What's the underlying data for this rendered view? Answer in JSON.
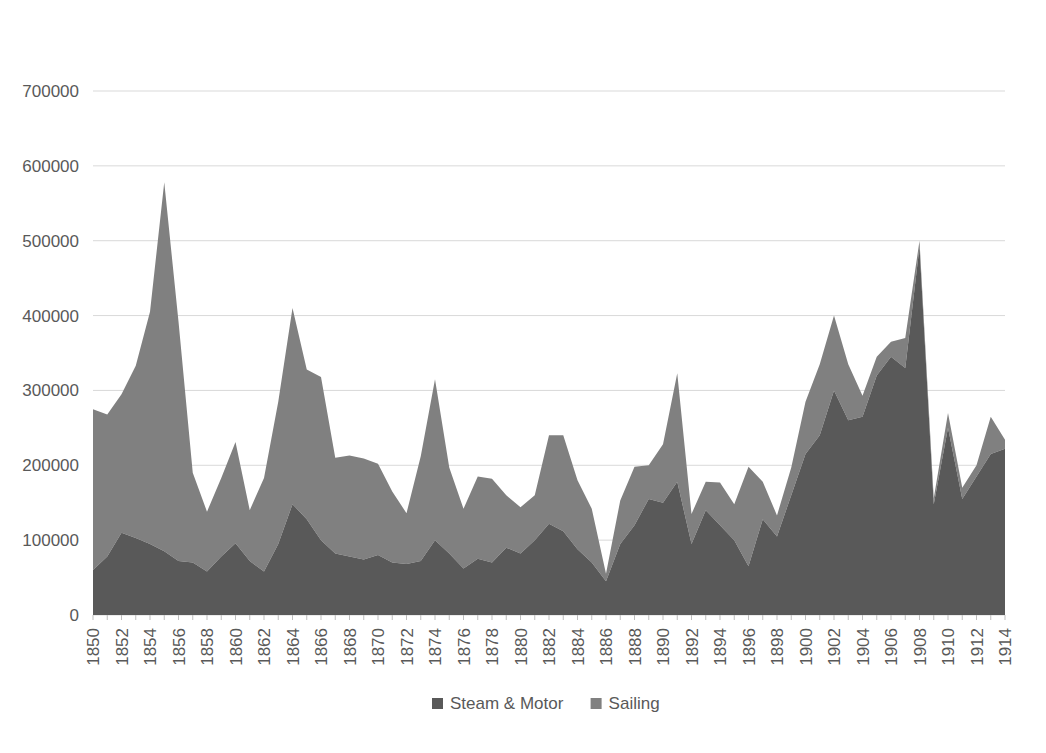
{
  "chart_data": {
    "type": "area",
    "stacked": true,
    "title": "",
    "subtitle": "",
    "xlabel": "",
    "ylabel": "",
    "ylim": [
      0,
      700000
    ],
    "ytick_labels": [
      "0",
      "100000",
      "200000",
      "300000",
      "400000",
      "500000",
      "600000",
      "700000"
    ],
    "ytick_values": [
      0,
      100000,
      200000,
      300000,
      400000,
      500000,
      600000,
      700000
    ],
    "grid": true,
    "grid_axis": "y",
    "legend_position": "bottom",
    "xtick_labels": [
      "1850",
      "1852",
      "1854",
      "1856",
      "1858",
      "1860",
      "1862",
      "1864",
      "1866",
      "1868",
      "1870",
      "1872",
      "1874",
      "1876",
      "1878",
      "1880",
      "1882",
      "1884",
      "1886",
      "1888",
      "1890",
      "1892",
      "1894",
      "1896",
      "1898",
      "1900",
      "1902",
      "1904",
      "1906",
      "1908",
      "1910",
      "1912",
      "1914"
    ],
    "xtick_rotation": 90,
    "x": [
      1850,
      1851,
      1852,
      1853,
      1854,
      1855,
      1856,
      1857,
      1858,
      1859,
      1860,
      1861,
      1862,
      1863,
      1864,
      1865,
      1866,
      1867,
      1868,
      1869,
      1870,
      1871,
      1872,
      1873,
      1874,
      1875,
      1876,
      1877,
      1878,
      1879,
      1880,
      1881,
      1882,
      1883,
      1884,
      1885,
      1886,
      1887,
      1888,
      1889,
      1890,
      1891,
      1892,
      1893,
      1894,
      1895,
      1896,
      1897,
      1898,
      1899,
      1900,
      1901,
      1902,
      1903,
      1904,
      1905,
      1906,
      1907,
      1908,
      1909,
      1910,
      1911,
      1912,
      1913,
      1914
    ],
    "series": [
      {
        "name": "Steam & Motor",
        "color": "#595959",
        "values": [
          60000,
          78000,
          110000,
          103000,
          95000,
          85000,
          72000,
          70000,
          58000,
          78000,
          96000,
          72000,
          58000,
          95000,
          148000,
          128000,
          100000,
          82000,
          78000,
          74000,
          80000,
          70000,
          68000,
          72000,
          100000,
          82000,
          62000,
          75000,
          70000,
          90000,
          82000,
          100000,
          122000,
          112000,
          88000,
          70000,
          45000,
          95000,
          120000,
          155000,
          150000,
          178000,
          95000,
          140000,
          120000,
          100000,
          65000,
          128000,
          105000,
          160000,
          215000,
          240000,
          300000,
          260000,
          265000,
          320000,
          345000,
          330000,
          492000,
          148000,
          250000,
          155000,
          185000,
          215000,
          222000
        ]
      },
      {
        "name": "Sailing",
        "color": "#808080",
        "values": [
          215000,
          190000,
          185000,
          230000,
          310000,
          493000,
          320000,
          120000,
          80000,
          105000,
          135000,
          68000,
          125000,
          190000,
          262000,
          200000,
          218000,
          128000,
          135000,
          135000,
          122000,
          95000,
          68000,
          140000,
          215000,
          115000,
          80000,
          110000,
          112000,
          70000,
          62000,
          60000,
          118000,
          128000,
          92000,
          72000,
          10000,
          58000,
          78000,
          45000,
          78000,
          145000,
          40000,
          38000,
          57000,
          48000,
          133000,
          50000,
          28000,
          37000,
          70000,
          95000,
          100000,
          75000,
          28000,
          25000,
          20000,
          40000,
          8000,
          8000,
          20000,
          15000,
          15000,
          50000,
          12000
        ]
      }
    ]
  },
  "legend": {
    "items": [
      {
        "label": "Steam & Motor",
        "color": "#595959"
      },
      {
        "label": "Sailing",
        "color": "#808080"
      }
    ]
  }
}
